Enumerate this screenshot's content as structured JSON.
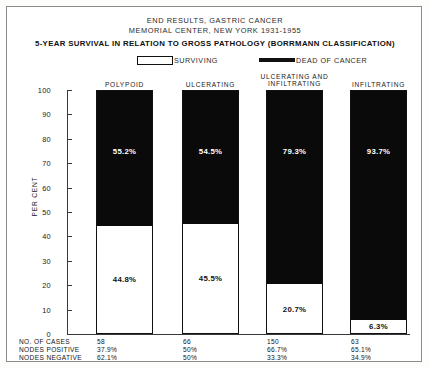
{
  "header": {
    "title_line1": "END RESULTS, GASTRIC CANCER",
    "title_line2": "MEMORIAL CENTER, NEW YORK  1931-1955",
    "subtitle": "5-YEAR SURVIVAL IN RELATION TO GROSS PATHOLOGY (BORRMANN CLASSIFICATION)"
  },
  "legend": {
    "surviving_label": "SURVIVING",
    "dead_label": "DEAD OF CANCER",
    "surviving_swatch": "white-box-swatch",
    "dead_swatch": "black-bar-swatch"
  },
  "footer": {
    "row_labels": [
      "NO. OF CASES",
      "NODES POSITIVE",
      "NODES NEGATIVE"
    ],
    "values": [
      [
        "58",
        "66",
        "150",
        "63"
      ],
      [
        "37.9%",
        "50%",
        "66.7%",
        "65.1%"
      ],
      [
        "62.1%",
        "50%",
        "33.3%",
        "34.9%"
      ]
    ]
  },
  "chart_data": {
    "type": "bar",
    "subtype": "stacked-100-percent",
    "title": "5-YEAR SURVIVAL IN RELATION TO GROSS PATHOLOGY (BORRMANN CLASSIFICATION)",
    "xlabel": "",
    "ylabel": "PER CENT",
    "ylim": [
      0,
      100
    ],
    "yticks": [
      0,
      10,
      20,
      30,
      40,
      50,
      60,
      70,
      80,
      90,
      100
    ],
    "ytick_labels": [
      "0",
      "10",
      "20",
      "30",
      "40",
      "50",
      "60",
      "70",
      "80",
      "90",
      "100"
    ],
    "grid": false,
    "legend_position": "top",
    "categories": [
      "POLYPOID",
      "ULCERATING",
      "ULCERATING AND\nINFILTRATING",
      "INFILTRATING"
    ],
    "series": [
      {
        "name": "DEAD OF CANCER",
        "color": "#0a0a0a",
        "values": [
          55.2,
          54.5,
          79.3,
          93.7
        ],
        "labels": [
          "55.2%",
          "54.5%",
          "79.3%",
          "93.7%"
        ]
      },
      {
        "name": "SURVIVING",
        "color": "#ffffff",
        "values": [
          44.8,
          45.5,
          20.7,
          6.3
        ],
        "labels": [
          "44.8%",
          "45.5%",
          "20.7%",
          "6.3%"
        ]
      }
    ],
    "annotations": {
      "no_of_cases": [
        58,
        66,
        150,
        63
      ],
      "nodes_positive": [
        "37.9%",
        "50%",
        "66.7%",
        "65.1%"
      ],
      "nodes_negative": [
        "62.1%",
        "50%",
        "33.3%",
        "34.9%"
      ]
    }
  }
}
